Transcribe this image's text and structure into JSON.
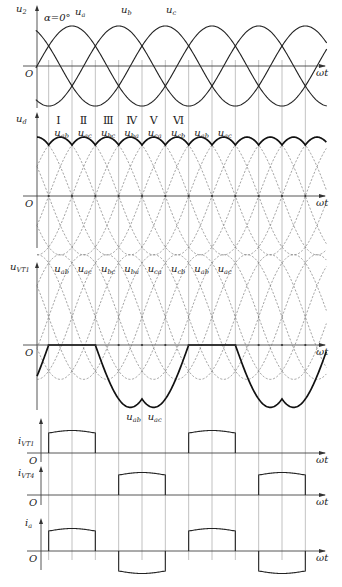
{
  "figure": {
    "alpha_label": "α=0°",
    "x_axis_label": "ωt",
    "origin_label": "O"
  },
  "plots": [
    {
      "id": "u2",
      "y_label": "u",
      "y_label_sub": "2",
      "phase_labels": [
        {
          "text": "u",
          "sub": "a"
        },
        {
          "text": "u",
          "sub": "b"
        },
        {
          "text": "u",
          "sub": "c"
        }
      ]
    },
    {
      "id": "ud",
      "y_label": "u",
      "y_label_sub": "d",
      "intervals": [
        "Ⅰ",
        "Ⅱ",
        "Ⅲ",
        "Ⅳ",
        "Ⅴ",
        "Ⅵ"
      ],
      "line_voltage_labels": [
        {
          "text": "u",
          "sub": "ab"
        },
        {
          "text": "u",
          "sub": "ac"
        },
        {
          "text": "u",
          "sub": "bc"
        },
        {
          "text": "u",
          "sub": "ba"
        },
        {
          "text": "u",
          "sub": "ca"
        },
        {
          "text": "u",
          "sub": "cb"
        },
        {
          "text": "u",
          "sub": "ab"
        },
        {
          "text": "u",
          "sub": "ac"
        }
      ]
    },
    {
      "id": "uVT1",
      "y_label": "u",
      "y_label_sub": "VT1",
      "line_voltage_labels": [
        {
          "text": "u",
          "sub": "ab"
        },
        {
          "text": "u",
          "sub": "ac"
        },
        {
          "text": "u",
          "sub": "bc"
        },
        {
          "text": "u",
          "sub": "ba"
        },
        {
          "text": "u",
          "sub": "ca"
        },
        {
          "text": "u",
          "sub": "cb"
        },
        {
          "text": "u",
          "sub": "ab"
        },
        {
          "text": "u",
          "sub": "ac"
        }
      ],
      "lower_labels": [
        {
          "text": "u",
          "sub": "ab"
        },
        {
          "text": "u",
          "sub": "ac"
        }
      ]
    },
    {
      "id": "iVT1",
      "y_label": "i",
      "y_label_sub": "VT1"
    },
    {
      "id": "iVT4",
      "y_label": "i",
      "y_label_sub": "VT4"
    },
    {
      "id": "ia",
      "y_label": "i",
      "y_label_sub": "a"
    }
  ],
  "chart_data": {
    "type": "line",
    "x_unit": "degrees (ωt)",
    "x_range": [
      0,
      840
    ],
    "series": [
      {
        "name": "u_a",
        "expr": "sin(ωt)"
      },
      {
        "name": "u_b",
        "expr": "sin(ωt-120°)"
      },
      {
        "name": "u_c",
        "expr": "sin(ωt+120°)"
      },
      {
        "name": "u_d",
        "expr": "max line voltage envelope, natural commutation at 30°,90°,150°..."
      },
      {
        "name": "u_VT1",
        "expr": "0 for 30°–150°; u_ab 150°–270°; u_ac 270°–390°"
      },
      {
        "name": "i_VT1",
        "on_intervals_deg": [
          [
            30,
            150
          ],
          [
            390,
            510
          ]
        ]
      },
      {
        "name": "i_VT4",
        "on_intervals_deg": [
          [
            210,
            330
          ],
          [
            570,
            690
          ]
        ]
      },
      {
        "name": "i_a",
        "positive_deg": [
          [
            30,
            150
          ],
          [
            390,
            510
          ]
        ],
        "negative_deg": [
          [
            210,
            330
          ],
          [
            570,
            690
          ]
        ]
      }
    ]
  }
}
